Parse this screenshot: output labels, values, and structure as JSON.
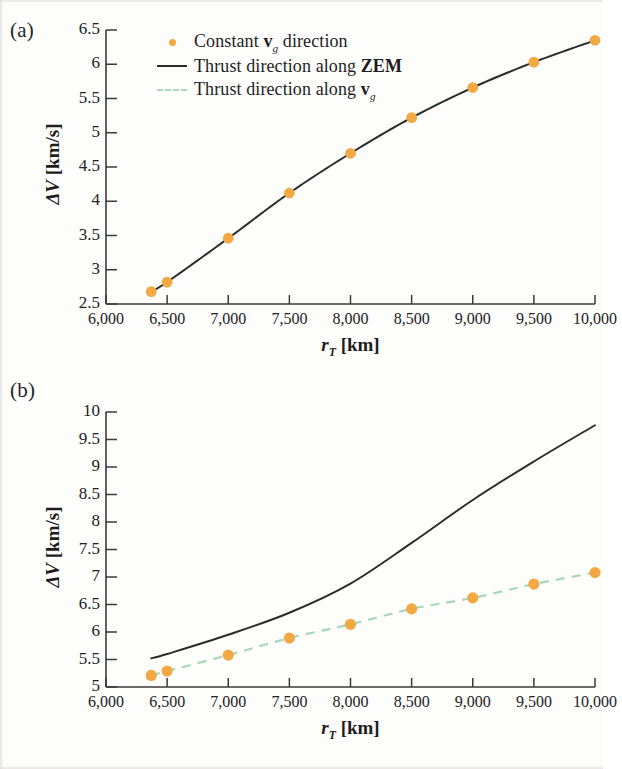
{
  "figure": {
    "panels": [
      {
        "tag": "(a)",
        "ylabel_prefix": "ΔV",
        "ylabel_unit": "[km/s]",
        "xlabel_symbol": "r",
        "xlabel_subscript": "T",
        "xlabel_unit": "[km]"
      },
      {
        "tag": "(b)",
        "ylabel_prefix": "ΔV",
        "ylabel_unit": "[km/s]",
        "xlabel_symbol": "r",
        "xlabel_subscript": "T",
        "xlabel_unit": "[km]"
      }
    ],
    "legend": {
      "position": "top-left-inside-panel-a",
      "items": [
        {
          "key": "dot",
          "text_before": "Constant ",
          "symbol": "v",
          "symbol_sub": "g",
          "text_after": " direction",
          "color": "#f2a944"
        },
        {
          "key": "line",
          "text_before": "Thrust direction along ",
          "symbol": "ZEM",
          "symbol_sub": "",
          "text_after": "",
          "color": "#2b2b2b"
        },
        {
          "key": "dash",
          "text_before": "Thrust direction along ",
          "symbol": "v",
          "symbol_sub": "g",
          "text_after": "",
          "color": "#a8d6bd"
        }
      ]
    },
    "colors": {
      "marker_orange": "#f2a944",
      "curve_black": "#2b2b2b",
      "curve_green_dashed": "#a8d6bd",
      "axis": "#3a3a3a",
      "background": "#fdfdfc"
    }
  },
  "chart_data": [
    {
      "type": "scatter",
      "panel": "(a)",
      "title": "",
      "xlabel": "r_T [km]",
      "ylabel": "ΔV [km/s]",
      "xlim": [
        6000,
        10000
      ],
      "ylim": [
        2.5,
        6.5
      ],
      "xticks": [
        6000,
        7000,
        8000,
        9000,
        10000
      ],
      "xtick_labels": [
        "6,000",
        "6,500",
        "7,000",
        "7,500",
        "8,000",
        "8,500",
        "9,000",
        "9,500",
        "10,000"
      ],
      "xtick_values": [
        6000,
        6500,
        7000,
        7500,
        8000,
        8500,
        9000,
        9500,
        10000
      ],
      "ytick_labels": [
        "6.5",
        "6",
        "5.5",
        "5",
        "4.5",
        "4",
        "3.5",
        "3",
        "2.5"
      ],
      "ytick_values": [
        6.5,
        6,
        5.5,
        5,
        4.5,
        4,
        3.5,
        3,
        2.5
      ],
      "grid": false,
      "legend_position": "upper left",
      "series": [
        {
          "name": "Constant v_g direction",
          "style": "markers",
          "color": "#f2a944",
          "x": [
            6370,
            6500,
            7000,
            7500,
            8000,
            8500,
            9000,
            9500,
            10000
          ],
          "values": [
            2.68,
            2.82,
            3.46,
            4.12,
            4.7,
            5.22,
            5.66,
            6.03,
            6.35
          ]
        },
        {
          "name": "Thrust direction along ZEM",
          "style": "line",
          "color": "#2b2b2b",
          "x": [
            6370,
            6500,
            7000,
            7500,
            8000,
            8500,
            9000,
            9500,
            10000
          ],
          "values": [
            2.68,
            2.82,
            3.46,
            4.12,
            4.7,
            5.22,
            5.66,
            6.03,
            6.35
          ]
        },
        {
          "name": "Thrust direction along v_g",
          "style": "dashed",
          "color": "#a8d6bd",
          "x": [
            6370,
            6500,
            7000,
            7500,
            8000,
            8500,
            9000,
            9500,
            10000
          ],
          "values": [
            2.68,
            2.82,
            3.46,
            4.12,
            4.7,
            5.22,
            5.66,
            6.03,
            6.35
          ]
        }
      ]
    },
    {
      "type": "scatter",
      "panel": "(b)",
      "title": "",
      "xlabel": "r_T [km]",
      "ylabel": "ΔV [km/s]",
      "xlim": [
        6000,
        10000
      ],
      "ylim": [
        5,
        10
      ],
      "xtick_labels": [
        "6,000",
        "6,500",
        "7,000",
        "7,500",
        "8,000",
        "8,500",
        "9,000",
        "9,500",
        "10,000"
      ],
      "xtick_values": [
        6000,
        6500,
        7000,
        7500,
        8000,
        8500,
        9000,
        9500,
        10000
      ],
      "ytick_labels": [
        "10",
        "9.5",
        "9",
        "8.5",
        "8",
        "7.5",
        "7",
        "6.5",
        "6",
        "5.5",
        "5"
      ],
      "ytick_values": [
        10,
        9.5,
        9,
        8.5,
        8,
        7.5,
        7,
        6.5,
        6,
        5.5,
        5
      ],
      "grid": false,
      "legend_position": "none",
      "series": [
        {
          "name": "Constant v_g direction",
          "style": "markers",
          "color": "#f2a944",
          "x": [
            6370,
            6500,
            7000,
            7500,
            8000,
            8500,
            9000,
            9500,
            10000
          ],
          "values": [
            5.21,
            5.29,
            5.58,
            5.89,
            6.14,
            6.42,
            6.62,
            6.87,
            7.08
          ]
        },
        {
          "name": "Thrust direction along ZEM",
          "style": "line",
          "color": "#2b2b2b",
          "x": [
            6370,
            6500,
            7000,
            7500,
            8000,
            8500,
            9000,
            9500,
            10000
          ],
          "values": [
            5.52,
            5.6,
            5.95,
            6.35,
            6.88,
            7.62,
            8.4,
            9.1,
            9.76
          ]
        },
        {
          "name": "Thrust direction along v_g",
          "style": "dashed",
          "color": "#a8d6bd",
          "x": [
            6370,
            6500,
            7000,
            7500,
            8000,
            8500,
            9000,
            9500,
            10000
          ],
          "values": [
            5.21,
            5.29,
            5.58,
            5.89,
            6.14,
            6.42,
            6.62,
            6.87,
            7.08
          ]
        }
      ]
    }
  ]
}
